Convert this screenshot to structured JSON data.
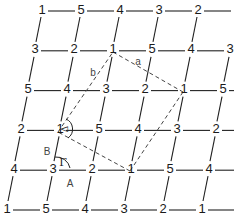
{
  "diagram": {
    "title": "",
    "grid": {
      "rows": [
        [
          "1",
          "5",
          "4",
          "3",
          "2"
        ],
        [
          "3",
          "2",
          "1",
          "5",
          "4",
          "3"
        ],
        [
          "5",
          "4",
          "3",
          "2",
          "1",
          "5"
        ],
        [
          "2",
          "1",
          "5",
          "4",
          "3",
          "2"
        ],
        [
          "4",
          "3",
          "2",
          "1",
          "5",
          "4"
        ],
        [
          "1",
          "5",
          "4",
          "3",
          "2",
          "1"
        ]
      ],
      "origin_x": 42,
      "origin_y": 9,
      "col_spacing": 39,
      "row_spacing": 39.8,
      "row_shift": -7,
      "line_color": "#222222",
      "dash_color": "#444444"
    },
    "dashed_parallelogram": {
      "vertices": [
        [
          113,
          49
        ],
        [
          183,
          89
        ],
        [
          130,
          168
        ],
        [
          58,
          129
        ]
      ],
      "edge_labels": [
        {
          "text": "a",
          "x": 138,
          "y": 61
        },
        {
          "text": "b",
          "x": 93,
          "y": 72
        }
      ]
    },
    "labels": {
      "delta": "Δ",
      "gamma": "Γ",
      "b_upper": "B",
      "a_upper": "A"
    }
  }
}
